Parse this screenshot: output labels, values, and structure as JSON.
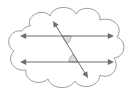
{
  "figure": {
    "title": "Parallel lines cut by a transversal inside a cloud callout",
    "canvas": {
      "width": 131,
      "height": 96
    },
    "colors": {
      "background": "#ffffff",
      "cloud_stroke": "#8f8f8f",
      "line_stroke": "#6e6e6e",
      "angle_fill": "#d8d8d8",
      "angle_stroke": "#8a8a8a"
    },
    "cloud": {
      "name": "cloud-callout-outline",
      "bumps": 11,
      "bbox": {
        "x": 5,
        "y": 6,
        "width": 121,
        "height": 84
      }
    },
    "lines": [
      {
        "name": "upper-parallel-line",
        "kind": "double-headed-arrow",
        "orientation": "horizontal",
        "x1": 20,
        "y1": 36,
        "x2": 114,
        "y2": 36,
        "arrow_start": true,
        "arrow_end": true
      },
      {
        "name": "lower-parallel-line",
        "kind": "double-headed-arrow",
        "orientation": "horizontal",
        "x1": 20,
        "y1": 62,
        "x2": 114,
        "y2": 62,
        "arrow_start": true,
        "arrow_end": true
      },
      {
        "name": "transversal-line",
        "kind": "double-headed-arrow",
        "orientation": "slanted",
        "x1": 53,
        "y1": 21,
        "x2": 88,
        "y2": 78,
        "arrow_start": true,
        "arrow_end": true
      }
    ],
    "intersections": [
      {
        "name": "upper-intersection-point",
        "x": 62,
        "y": 36
      },
      {
        "name": "lower-intersection-point",
        "x": 78,
        "y": 62
      }
    ],
    "angles": [
      {
        "name": "upper-angle-marker",
        "vertex_x": 62,
        "vertex_y": 36,
        "position": "below upper parallel line, right of transversal",
        "radius": 9,
        "shaded": true
      },
      {
        "name": "lower-angle-marker",
        "vertex_x": 78,
        "vertex_y": 62,
        "position": "above lower parallel line, left of transversal",
        "radius": 9,
        "shaded": true
      }
    ]
  }
}
